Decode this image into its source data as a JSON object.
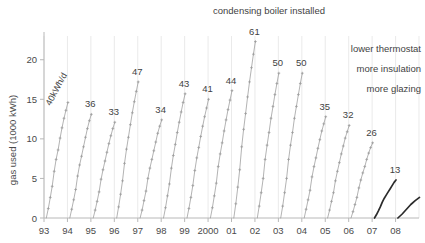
{
  "chart_data": {
    "type": "line",
    "title": "",
    "xlabel": "",
    "ylabel": "gas used (1000 kWh)",
    "ylim": [
      0,
      23
    ],
    "yticks": [
      0,
      5,
      10,
      15,
      20
    ],
    "ytick_labels": [
      "0",
      "5",
      "10",
      "15",
      "20"
    ],
    "xtick_labels": [
      "93",
      "94",
      "95",
      "96",
      "97",
      "98",
      "99",
      "2000",
      "01",
      "02",
      "03",
      "04",
      "05",
      "06",
      "07",
      "08"
    ],
    "grid": "faint vertical gridlines only",
    "legend": "none",
    "series": [
      {
        "name": "1993",
        "label": "40kWh/d",
        "label_rotated": true,
        "year_total_kwh_per_day": 40,
        "cumulative_end": 14.6,
        "points": [
          0,
          1.2,
          2.6,
          4.0,
          5.9,
          7.4,
          8.6,
          10.1,
          11.4,
          12.6,
          13.6,
          14.6
        ]
      },
      {
        "name": "1994",
        "label": "36",
        "year_total_kwh_per_day": 36,
        "cumulative_end": 13.1,
        "points": [
          0,
          1.1,
          2.3,
          3.6,
          5.3,
          6.7,
          7.8,
          9.0,
          10.2,
          11.3,
          12.3,
          13.1
        ]
      },
      {
        "name": "1995",
        "label": "33",
        "year_total_kwh_per_day": 33,
        "cumulative_end": 12.1,
        "points": [
          0,
          1.0,
          2.1,
          3.3,
          4.9,
          6.1,
          7.2,
          8.3,
          9.4,
          10.4,
          11.3,
          12.1
        ]
      },
      {
        "name": "1996",
        "label": "47",
        "year_total_kwh_per_day": 47,
        "cumulative_end": 17.2,
        "points": [
          0,
          1.4,
          3.0,
          4.7,
          6.9,
          8.7,
          10.2,
          11.8,
          13.3,
          14.7,
          16.0,
          17.2
        ]
      },
      {
        "name": "1997",
        "label": "34",
        "year_total_kwh_per_day": 34,
        "cumulative_end": 12.4,
        "points": [
          0,
          1.0,
          2.2,
          3.4,
          5.0,
          6.3,
          7.4,
          8.5,
          9.6,
          10.7,
          11.6,
          12.4
        ]
      },
      {
        "name": "1998",
        "label": "43",
        "year_total_kwh_per_day": 43,
        "cumulative_end": 15.7,
        "points": [
          0,
          1.3,
          2.8,
          4.3,
          6.3,
          7.9,
          9.3,
          10.8,
          12.1,
          13.4,
          14.6,
          15.7
        ]
      },
      {
        "name": "1999",
        "label": "41",
        "year_total_kwh_per_day": 41,
        "cumulative_end": 15.0,
        "points": [
          0,
          1.2,
          2.6,
          4.1,
          6.0,
          7.6,
          8.9,
          10.3,
          11.6,
          12.8,
          13.9,
          15.0
        ]
      },
      {
        "name": "2000",
        "label": "44",
        "year_total_kwh_per_day": 44,
        "cumulative_end": 16.1,
        "points": [
          0,
          1.3,
          2.8,
          4.4,
          6.5,
          8.1,
          9.5,
          11.0,
          12.4,
          13.7,
          14.9,
          16.1
        ]
      },
      {
        "name": "2001",
        "label": "61",
        "year_total_kwh_per_day": 61,
        "cumulative_end": 22.3,
        "points": [
          0,
          1.8,
          3.9,
          6.1,
          9.0,
          11.2,
          13.2,
          15.3,
          17.2,
          19.0,
          20.7,
          22.3
        ]
      },
      {
        "name": "2002",
        "label": "50",
        "year_total_kwh_per_day": 50,
        "cumulative_end": 18.3,
        "points": [
          0,
          1.5,
          3.2,
          5.0,
          7.4,
          9.2,
          10.8,
          12.6,
          14.1,
          15.6,
          17.0,
          18.3
        ]
      },
      {
        "name": "2003",
        "label": "50",
        "year_total_kwh_per_day": 50,
        "cumulative_end": 18.3,
        "points": [
          0,
          1.5,
          3.2,
          5.0,
          7.4,
          9.2,
          10.8,
          12.6,
          14.1,
          15.6,
          17.0,
          18.3
        ]
      },
      {
        "name": "2004",
        "label": "35",
        "year_total_kwh_per_day": 35,
        "cumulative_end": 12.8,
        "points": [
          0,
          1.1,
          2.3,
          3.5,
          5.2,
          6.5,
          7.6,
          8.8,
          9.9,
          11.0,
          11.9,
          12.8
        ]
      },
      {
        "name": "2005",
        "label": "32",
        "year_total_kwh_per_day": 32,
        "cumulative_end": 11.7,
        "points": [
          0,
          1.0,
          2.1,
          3.2,
          4.7,
          5.9,
          7.0,
          8.1,
          9.1,
          10.1,
          10.9,
          11.7
        ]
      },
      {
        "name": "2006",
        "label": "26",
        "year_total_kwh_per_day": 26,
        "cumulative_end": 9.5,
        "points": [
          0,
          0.8,
          1.7,
          2.6,
          3.8,
          4.8,
          5.7,
          6.5,
          7.4,
          8.2,
          8.9,
          9.5
        ]
      },
      {
        "name": "2007",
        "label": "13",
        "year_total_kwh_per_day": 13,
        "cumulative_end": 4.8,
        "points": [
          0,
          0.4,
          0.9,
          1.4,
          2.0,
          2.5,
          2.9,
          3.3,
          3.7,
          4.1,
          4.5,
          4.8
        ]
      },
      {
        "name": "2008",
        "label": "",
        "year_total_kwh_per_day": null,
        "cumulative_end": 2.6,
        "partial_year": true,
        "points": [
          0,
          0.5,
          1.1,
          1.7,
          2.2,
          2.6
        ]
      }
    ],
    "annotations": [
      {
        "text": "condensing boiler installed",
        "target_year": "2001",
        "align": "center"
      },
      {
        "text": "lower thermostat",
        "align": "right"
      },
      {
        "text": "more insulation",
        "align": "right"
      },
      {
        "text": "more glazing",
        "align": "right"
      }
    ]
  },
  "colors": {
    "axis": "#b8b8b8",
    "gridline": "#dcdcdc",
    "line_light": "#9a9a9a",
    "line_dark": "#2b2b2b",
    "text": "#3f3f3f"
  }
}
